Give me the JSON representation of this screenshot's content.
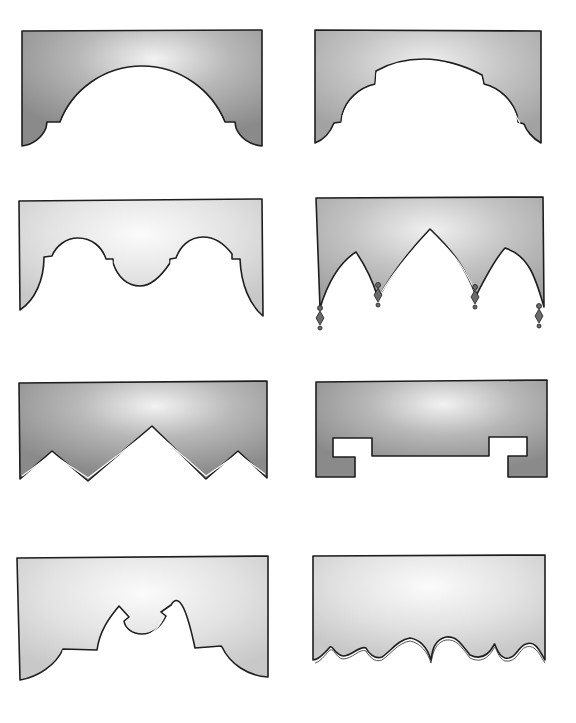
{
  "figure": {
    "background": "#ffffff",
    "stroke_color": "#1e1e1e",
    "fill_dark": "#8f8f8f",
    "fill_medium": "#b4b4b4",
    "fill_light": "#d9d9d9",
    "highlight": "#f4f4f4"
  },
  "shapes": [
    {
      "id": 1,
      "name": "arched-cornice-with-corner-steps",
      "row": 1,
      "col": 1,
      "tone": "dark"
    },
    {
      "id": 2,
      "name": "stepped-arch-cornice",
      "row": 1,
      "col": 2,
      "tone": "medium"
    },
    {
      "id": 3,
      "name": "double-arch-scalloped-valance",
      "row": 2,
      "col": 1,
      "tone": "light"
    },
    {
      "id": 4,
      "name": "gothic-pointed-arch-valance-with-tassels",
      "row": 2,
      "col": 2,
      "tone": "medium"
    },
    {
      "id": 5,
      "name": "zigzag-sawtooth-cornice",
      "row": 3,
      "col": 1,
      "tone": "dark"
    },
    {
      "id": 6,
      "name": "keyed-rectangular-cornice",
      "row": 3,
      "col": 2,
      "tone": "dark"
    },
    {
      "id": 7,
      "name": "keyhole-arch-valance",
      "row": 4,
      "col": 1,
      "tone": "light"
    },
    {
      "id": 8,
      "name": "wavy-scalloped-hem-valance",
      "row": 4,
      "col": 2,
      "tone": "light"
    }
  ]
}
